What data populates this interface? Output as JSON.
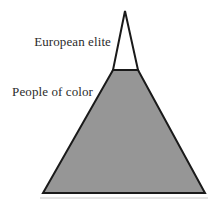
{
  "figure": {
    "width": 213,
    "height": 203,
    "background_color": "#ffffff",
    "type": "pyramid-diagram"
  },
  "diagram": {
    "stroke_color": "#1a1a1a",
    "stroke_width": 2,
    "baseline_color": "#c8c8c8",
    "segments": [
      {
        "id": "apex",
        "name": "European elite",
        "fill_color": "#ffffff",
        "label": "European elite",
        "relative_size": "small"
      },
      {
        "id": "base",
        "name": "People of color",
        "fill_color": "#969696",
        "label": "People of color",
        "relative_size": "large"
      }
    ]
  },
  "labels": {
    "apex_label": "European elite",
    "base_label": "People of color"
  },
  "geometry": {
    "apex_tip_x": 125,
    "apex_tip_y": 11,
    "divider_y": 70,
    "divider_left_x": 113,
    "divider_right_x": 138,
    "base_y": 193,
    "base_left_x": 43,
    "base_right_x": 205
  }
}
